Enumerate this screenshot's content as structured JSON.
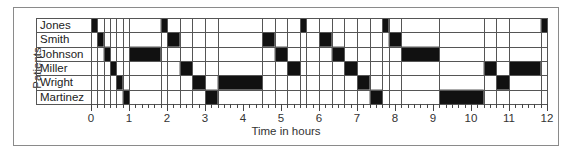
{
  "chart_data": {
    "type": "gantt",
    "title": "",
    "xlabel": "Time in hours",
    "ylabel": "Patients",
    "xlim": [
      0,
      12
    ],
    "x_ticks": [
      0,
      1,
      2,
      3,
      4,
      5,
      6,
      7,
      8,
      9,
      10,
      11,
      12
    ],
    "minor_tick_step": 0.1666667,
    "grid": true,
    "categories": [
      "Jones",
      "Smith",
      "Johnson",
      "Miller",
      "Wright",
      "Martinez"
    ],
    "segments": [
      {
        "patient": "Jones",
        "start": 0.0,
        "end": 0.1667
      },
      {
        "patient": "Smith",
        "start": 0.1667,
        "end": 0.3333
      },
      {
        "patient": "Johnson",
        "start": 0.3333,
        "end": 0.5
      },
      {
        "patient": "Miller",
        "start": 0.5,
        "end": 0.6667
      },
      {
        "patient": "Wright",
        "start": 0.6667,
        "end": 0.8333
      },
      {
        "patient": "Martinez",
        "start": 0.8333,
        "end": 1.0
      },
      {
        "patient": "Johnson",
        "start": 1.0,
        "end": 1.8333
      },
      {
        "patient": "Jones",
        "start": 1.8333,
        "end": 2.0
      },
      {
        "patient": "Smith",
        "start": 2.0,
        "end": 2.3333
      },
      {
        "patient": "Miller",
        "start": 2.3333,
        "end": 2.6667
      },
      {
        "patient": "Wright",
        "start": 2.6667,
        "end": 3.0
      },
      {
        "patient": "Martinez",
        "start": 3.0,
        "end": 3.3333
      },
      {
        "patient": "Wright",
        "start": 3.3333,
        "end": 4.5
      },
      {
        "patient": "Smith",
        "start": 4.5,
        "end": 4.8333
      },
      {
        "patient": "Johnson",
        "start": 4.8333,
        "end": 5.1667
      },
      {
        "patient": "Miller",
        "start": 5.1667,
        "end": 5.5
      },
      {
        "patient": "Jones",
        "start": 5.5,
        "end": 5.6667
      },
      {
        "patient": "Smith",
        "start": 6.0,
        "end": 6.3333
      },
      {
        "patient": "Johnson",
        "start": 6.3333,
        "end": 6.6667
      },
      {
        "patient": "Miller",
        "start": 6.6667,
        "end": 7.0
      },
      {
        "patient": "Wright",
        "start": 7.0,
        "end": 7.3333
      },
      {
        "patient": "Martinez",
        "start": 7.3333,
        "end": 7.6667
      },
      {
        "patient": "Jones",
        "start": 7.6667,
        "end": 7.8333
      },
      {
        "patient": "Smith",
        "start": 7.8333,
        "end": 8.1667
      },
      {
        "patient": "Johnson",
        "start": 8.1667,
        "end": 9.1667
      },
      {
        "patient": "Martinez",
        "start": 9.1667,
        "end": 10.3333
      },
      {
        "patient": "Miller",
        "start": 10.3333,
        "end": 10.6667
      },
      {
        "patient": "Wright",
        "start": 10.6667,
        "end": 11.0
      },
      {
        "patient": "Miller",
        "start": 11.0,
        "end": 11.8333
      },
      {
        "patient": "Jones",
        "start": 11.8333,
        "end": 12.0
      }
    ],
    "extra_gridlines": [
      5.6667,
      6.0
    ],
    "colors": {
      "bar": "#111111",
      "grid": "#555555",
      "frame": "#8a8a8a"
    }
  }
}
